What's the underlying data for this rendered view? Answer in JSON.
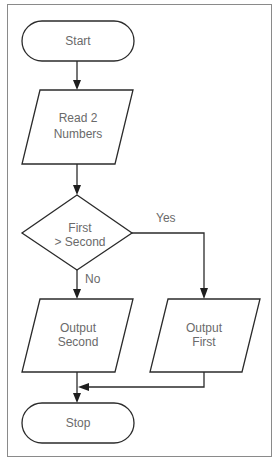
{
  "diagram": {
    "type": "flowchart",
    "nodes": {
      "start": {
        "shape": "terminal",
        "label": "Start"
      },
      "read": {
        "shape": "parallelogram",
        "line1": "Read 2",
        "line2": "Numbers"
      },
      "decision": {
        "shape": "diamond",
        "line1": "First",
        "line2": "> Second"
      },
      "output_second": {
        "shape": "parallelogram",
        "line1": "Output",
        "line2": "Second"
      },
      "output_first": {
        "shape": "parallelogram",
        "line1": "Output",
        "line2": "First"
      },
      "stop": {
        "shape": "terminal",
        "label": "Stop"
      }
    },
    "edges": [
      {
        "from": "start",
        "to": "read",
        "label": ""
      },
      {
        "from": "read",
        "to": "decision",
        "label": ""
      },
      {
        "from": "decision",
        "to": "output_first",
        "label": "Yes"
      },
      {
        "from": "decision",
        "to": "output_second",
        "label": "No"
      },
      {
        "from": "output_first",
        "to": "stop",
        "label": ""
      },
      {
        "from": "output_second",
        "to": "stop",
        "label": ""
      }
    ],
    "edge_labels": {
      "yes": "Yes",
      "no": "No"
    },
    "colors": {
      "line": "#2b2b2b",
      "text": "#6a6a6a",
      "frame": "#8a8a8a",
      "background": "#ffffff"
    }
  }
}
